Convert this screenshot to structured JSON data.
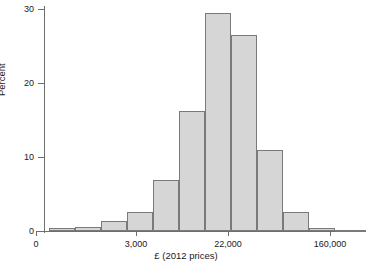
{
  "chart_data": {
    "type": "bar",
    "title": "",
    "xlabel": "£ (2012 prices)",
    "ylabel": "Percent",
    "ylim": [
      0,
      30
    ],
    "ytick_labels": [
      "0",
      "10",
      "20",
      "30"
    ],
    "ytick_values": [
      0,
      10,
      20,
      30
    ],
    "xtick_labels": [
      "0",
      "3,000",
      "22,000",
      "160,000"
    ],
    "grid": false,
    "legend": "none",
    "bar_fill_color": "#d6d6d6",
    "bar_edge_color": "#7a7a7a",
    "axis_color": "#6e6e6e",
    "note": "log-scaled horizontal axis; bin edges evenly spaced in pixels",
    "categories": [
      "b1",
      "b2",
      "b3",
      "b4",
      "b5",
      "b6",
      "b7",
      "b8",
      "b9",
      "b10",
      "b11",
      "b12",
      "b13"
    ],
    "values": [
      0.4,
      0.6,
      1.3,
      2.6,
      6.8,
      16.1,
      29.3,
      26.4,
      10.9,
      2.6,
      0.4,
      0.2,
      0.1
    ]
  },
  "axes": {
    "y_title": "Percent",
    "x_title": "£ (2012 prices)"
  }
}
